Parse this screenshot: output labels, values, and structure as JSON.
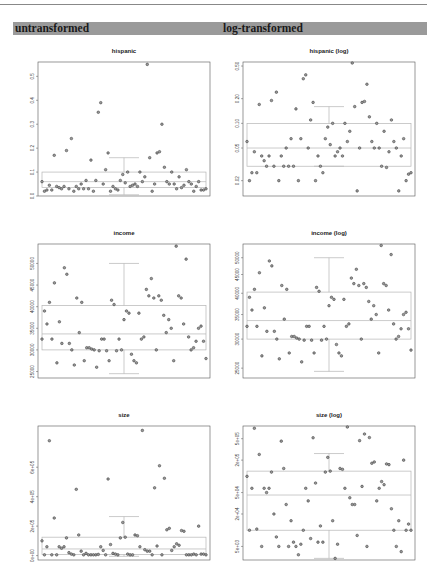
{
  "header": {
    "left_label": "untransformed",
    "right_label": "log-transformed",
    "bar_color": "#9a9a9a"
  },
  "chart_data": [
    {
      "id": "hispanic",
      "type": "scatter",
      "overlay": "boxplot",
      "title": "hispanic",
      "xlabel": "",
      "ylabel": "",
      "ylim": [
        0.0,
        0.56
      ],
      "yscale": "linear",
      "yticks": [
        0.0,
        0.1,
        0.2,
        0.3,
        0.4,
        0.5
      ],
      "ytick_labels": [
        "0.0",
        "0.1",
        "0.2",
        "0.3",
        "0.4",
        "0.5"
      ],
      "boxplot": {
        "whisker_low": 0.005,
        "q1": 0.035,
        "median": 0.06,
        "q3": 0.1,
        "whisker_high": 0.16
      },
      "values": [
        0.06,
        0.02,
        0.025,
        0.045,
        0.025,
        0.17,
        0.04,
        0.035,
        0.03,
        0.04,
        0.19,
        0.03,
        0.24,
        0.02,
        0.04,
        0.03,
        0.05,
        0.03,
        0.065,
        0.03,
        0.15,
        0.02,
        0.065,
        0.35,
        0.39,
        0.05,
        0.11,
        0.18,
        0.02,
        0.04,
        0.03,
        0.025,
        0.065,
        0.09,
        0.055,
        0.1,
        0.04,
        0.045,
        0.05,
        0.04,
        0.1,
        0.06,
        0.08,
        0.55,
        0.16,
        0.02,
        0.05,
        0.18,
        0.185,
        0.3,
        0.12,
        0.06,
        0.05,
        0.1,
        0.05,
        0.03,
        0.08,
        0.035,
        0.045,
        0.11,
        0.06,
        0.05,
        0.02,
        0.04,
        0.06,
        0.025,
        0.025,
        0.03
      ]
    },
    {
      "id": "hispanic-log",
      "type": "scatter",
      "overlay": "boxplot",
      "title": "hispanic (log)",
      "xlabel": "",
      "ylabel": "",
      "ylim": [
        0.013,
        0.56
      ],
      "yscale": "log",
      "yticks": [
        0.02,
        0.05,
        0.1,
        0.2,
        0.5
      ],
      "ytick_labels": [
        "0.02",
        "0.05",
        "0.10",
        "0.20",
        "0.50"
      ],
      "boxplot": {
        "whisker_low": 0.03,
        "q1": 0.03,
        "median": 0.05,
        "q3": 0.1,
        "whisker_high": 0.16
      },
      "values": [
        0.06,
        0.02,
        0.025,
        0.045,
        0.025,
        0.17,
        0.04,
        0.035,
        0.03,
        0.04,
        0.19,
        0.03,
        0.24,
        0.02,
        0.04,
        0.03,
        0.05,
        0.03,
        0.065,
        0.03,
        0.15,
        0.02,
        0.065,
        0.35,
        0.39,
        0.05,
        0.11,
        0.18,
        0.02,
        0.04,
        0.03,
        0.025,
        0.065,
        0.09,
        0.055,
        0.1,
        0.04,
        0.045,
        0.05,
        0.04,
        0.1,
        0.06,
        0.08,
        0.55,
        0.16,
        0.015,
        0.05,
        0.18,
        0.185,
        0.3,
        0.12,
        0.06,
        0.05,
        0.1,
        0.05,
        0.03,
        0.08,
        0.029,
        0.045,
        0.11,
        0.06,
        0.05,
        0.015,
        0.04,
        0.065,
        0.02,
        0.024,
        0.025
      ]
    },
    {
      "id": "income",
      "type": "scatter",
      "overlay": "boxplot",
      "title": "income",
      "xlabel": "",
      "ylabel": "",
      "ylim": [
        23500,
        54500
      ],
      "yscale": "linear",
      "yticks": [
        25000,
        30000,
        35000,
        40000,
        45000,
        50000
      ],
      "ytick_labels": [
        "25000",
        "30000",
        "35000",
        "40000",
        "45000",
        "50000"
      ],
      "boxplot": {
        "whisker_low": 24500,
        "q1": 30000,
        "median": 33700,
        "q3": 40300,
        "whisker_high": 50000
      },
      "values": [
        32500,
        39000,
        36000,
        41000,
        32500,
        45500,
        27000,
        36500,
        31500,
        49000,
        47500,
        31500,
        30000,
        26500,
        42000,
        34000,
        41000,
        27500,
        30500,
        30500,
        30200,
        30000,
        26000,
        29800,
        32500,
        32500,
        29800,
        27500,
        41500,
        40500,
        29800,
        32500,
        30000,
        37000,
        39000,
        38500,
        29000,
        27500,
        27000,
        38500,
        32500,
        33000,
        44000,
        42500,
        46500,
        42000,
        30000,
        42500,
        41500,
        38000,
        34000,
        37000,
        35000,
        27500,
        54000,
        42500,
        42000,
        36000,
        51000,
        33000,
        30000,
        30500,
        32000,
        35000,
        35500,
        32000,
        28000
      ]
    },
    {
      "id": "income-log",
      "type": "scatter",
      "overlay": "boxplot",
      "title": "income (log)",
      "xlabel": "",
      "ylabel": "",
      "ylim": [
        23500,
        54500
      ],
      "yscale": "log",
      "yticks": [
        25000,
        30000,
        35000,
        40000,
        45000,
        50000
      ],
      "ytick_labels": [
        "25000",
        "30000",
        "35000",
        "40000",
        "45000",
        "50000"
      ],
      "boxplot": {
        "whisker_low": 24500,
        "q1": 30000,
        "median": 33700,
        "q3": 40300,
        "whisker_high": 50000
      },
      "values": [
        32500,
        39000,
        36000,
        41000,
        32500,
        45500,
        27000,
        36500,
        31500,
        49000,
        47500,
        31500,
        30000,
        26500,
        42000,
        34000,
        41000,
        27500,
        30500,
        30500,
        30200,
        30000,
        26000,
        29800,
        32500,
        32500,
        29800,
        27500,
        41500,
        40500,
        29800,
        32500,
        30000,
        37000,
        39000,
        38500,
        29000,
        27500,
        27000,
        38500,
        32500,
        33000,
        44000,
        42500,
        46500,
        42000,
        30000,
        42500,
        41500,
        38000,
        34000,
        37000,
        35000,
        27500,
        54000,
        42500,
        42000,
        36000,
        51000,
        33000,
        30000,
        30500,
        32000,
        35000,
        35500,
        32000,
        28000
      ]
    },
    {
      "id": "size",
      "type": "scatter",
      "overlay": "boxplot",
      "title": "size",
      "xlabel": "",
      "ylabel": "",
      "ylim": [
        -30000,
        880000
      ],
      "yscale": "linear",
      "yticks": [
        0,
        200000,
        400000,
        600000
      ],
      "ytick_labels": [
        "0e+00",
        "2e+05",
        "4e+05",
        "6e+05"
      ],
      "boxplot": {
        "whisker_low": -5000,
        "q1": 8000,
        "median": 45000,
        "q3": 125000,
        "whisker_high": 265000
      },
      "values": [
        100000,
        5000,
        60000,
        780000,
        5000,
        255000,
        5000,
        60000,
        50000,
        60000,
        120000,
        20000,
        10000,
        5000,
        450000,
        140000,
        30000,
        5000,
        15000,
        5000,
        5000,
        5000,
        5000,
        8000,
        60000,
        35000,
        5000,
        520000,
        75000,
        15000,
        10000,
        5000,
        120000,
        225000,
        125000,
        10000,
        5000,
        5000,
        140000,
        135000,
        60000,
        850000,
        40000,
        30000,
        30000,
        5000,
        460000,
        65000,
        610000,
        5000,
        525000,
        175000,
        185000,
        35000,
        60000,
        80000,
        70000,
        170000,
        165000,
        5000,
        5000,
        5000,
        10000,
        5000,
        200000,
        10000,
        10000,
        5000
      ]
    },
    {
      "id": "size-log",
      "type": "scatter",
      "overlay": "boxplot",
      "title": "size (log)",
      "xlabel": "",
      "ylabel": "",
      "ylim": [
        2800,
        860000
      ],
      "yscale": "log",
      "yticks": [
        5000,
        20000,
        50000,
        200000,
        500000
      ],
      "ytick_labels": [
        "5e+03",
        "2e+04",
        "5e+04",
        "2e+05",
        "5e+05"
      ],
      "boxplot": {
        "whisker_low": 3000,
        "q1": 10000,
        "median": 45000,
        "q3": 125000,
        "whisker_high": 265000
      },
      "values": [
        100000,
        10000,
        60000,
        780000,
        10500,
        255000,
        5000,
        60000,
        50000,
        60000,
        120000,
        20000,
        7500,
        5000,
        450000,
        140000,
        30000,
        5000,
        15000,
        6000,
        5000,
        3500,
        5500,
        10000,
        60000,
        35000,
        7000,
        520000,
        75000,
        6000,
        12000,
        6000,
        120000,
        225000,
        125000,
        15000,
        3000,
        5500,
        140000,
        135000,
        60000,
        850000,
        40000,
        30000,
        30000,
        8000,
        460000,
        65000,
        610000,
        5000,
        525000,
        175000,
        185000,
        35000,
        60000,
        80000,
        70000,
        170000,
        165000,
        25000,
        10000,
        5000,
        15000,
        4000,
        200000,
        10000,
        13000,
        10000
      ]
    }
  ]
}
